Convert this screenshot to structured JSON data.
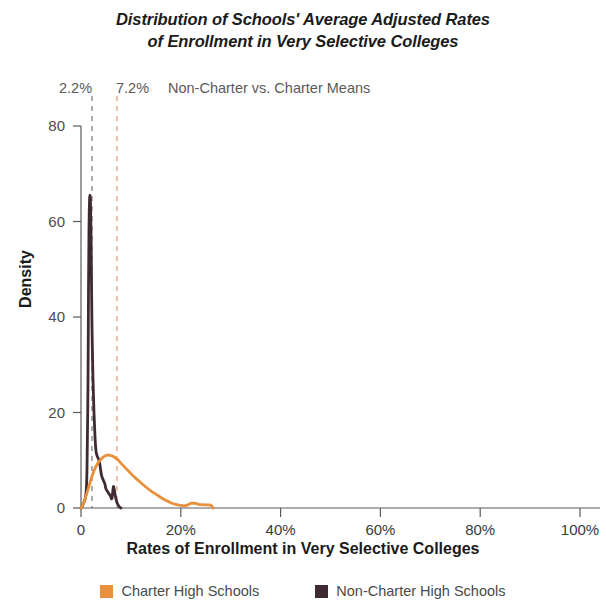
{
  "title": {
    "line1": "Distribution of Schools' Average Adjusted Rates",
    "line2": "of Enrollment in Very Selective Colleges"
  },
  "annotation": {
    "mean_non_charter": "2.2%",
    "mean_charter": "7.2%",
    "text": "Non-Charter vs. Charter Means"
  },
  "axes": {
    "ylabel": "Density",
    "xlabel": "Rates of Enrollment in Very Selective Colleges",
    "yticks": [
      "0",
      "20",
      "40",
      "60",
      "80"
    ],
    "xticks": [
      "0",
      "20%",
      "40%",
      "60%",
      "80%",
      "100%"
    ]
  },
  "legend": {
    "items": [
      {
        "label": "Charter High Schools",
        "color": "#e8903c"
      },
      {
        "label": "Non-Charter High Schools",
        "color": "#3e2a33"
      }
    ]
  },
  "chart_data": {
    "type": "line",
    "title": "Distribution of Schools' Average Adjusted Rates of Enrollment in Very Selective Colleges",
    "xlabel": "Rates of Enrollment in Very Selective Colleges",
    "ylabel": "Density",
    "xlim": [
      0,
      100
    ],
    "ylim": [
      0,
      80
    ],
    "xtick_values": [
      0,
      20,
      40,
      60,
      80,
      100
    ],
    "ytick_values": [
      0,
      20,
      40,
      60,
      80
    ],
    "grid": false,
    "legend_position": "bottom",
    "annotations": [
      {
        "label": "2.2%",
        "x": 2.2,
        "kind": "vline",
        "style": "dashed",
        "color": "#8b8b8b",
        "series": "Non-Charter High Schools"
      },
      {
        "label": "7.2%",
        "x": 7.2,
        "kind": "vline",
        "style": "dashed",
        "color": "#e8a88c",
        "series": "Charter High Schools"
      },
      {
        "label": "Non-Charter vs. Charter Means",
        "kind": "text"
      }
    ],
    "series": [
      {
        "name": "Non-Charter High Schools",
        "color": "#3e2a33",
        "x": [
          0.0,
          0.3,
          0.7,
          1.0,
          1.2,
          1.4,
          1.5,
          1.6,
          1.7,
          1.8,
          1.9,
          2.0,
          2.1,
          2.2,
          2.4,
          2.6,
          2.8,
          3.0,
          3.2,
          3.4,
          3.6,
          3.8,
          4.0,
          4.2,
          4.4,
          4.6,
          4.8,
          5.0,
          5.3,
          5.6,
          5.9,
          6.2,
          6.5,
          6.8,
          7.1,
          7.4,
          7.7,
          8.0
        ],
        "y": [
          0.0,
          0.5,
          1.5,
          3.0,
          8.0,
          26.0,
          45.0,
          58.0,
          64.0,
          65.5,
          64.0,
          58.0,
          48.0,
          38.0,
          27.0,
          20.0,
          15.0,
          12.0,
          11.0,
          10.5,
          10.0,
          9.0,
          7.5,
          6.5,
          6.0,
          5.5,
          5.0,
          4.0,
          3.5,
          3.0,
          2.5,
          2.0,
          4.5,
          3.0,
          1.5,
          0.7,
          0.2,
          0.0
        ]
      },
      {
        "name": "Charter High Schools",
        "color": "#e8903c",
        "x": [
          0.0,
          0.5,
          1.0,
          1.5,
          2.0,
          2.5,
          3.0,
          3.5,
          4.0,
          4.5,
          5.0,
          5.5,
          6.0,
          6.5,
          7.0,
          7.5,
          8.0,
          9.0,
          10.0,
          11.0,
          12.0,
          13.0,
          14.0,
          15.0,
          16.0,
          17.0,
          18.0,
          19.0,
          20.0,
          20.5,
          21.0,
          21.5,
          22.0,
          22.5,
          23.0,
          23.5,
          24.0,
          25.0,
          26.0,
          26.5
        ],
        "y": [
          0.0,
          1.0,
          2.5,
          4.2,
          6.0,
          7.5,
          8.7,
          9.6,
          10.2,
          10.7,
          11.0,
          11.1,
          11.0,
          10.8,
          10.4,
          10.0,
          9.4,
          8.3,
          7.2,
          6.2,
          5.3,
          4.4,
          3.6,
          2.9,
          2.2,
          1.6,
          1.1,
          0.75,
          0.55,
          0.5,
          0.5,
          0.7,
          0.95,
          1.0,
          0.95,
          0.8,
          0.7,
          0.65,
          0.6,
          0.0
        ]
      }
    ]
  }
}
